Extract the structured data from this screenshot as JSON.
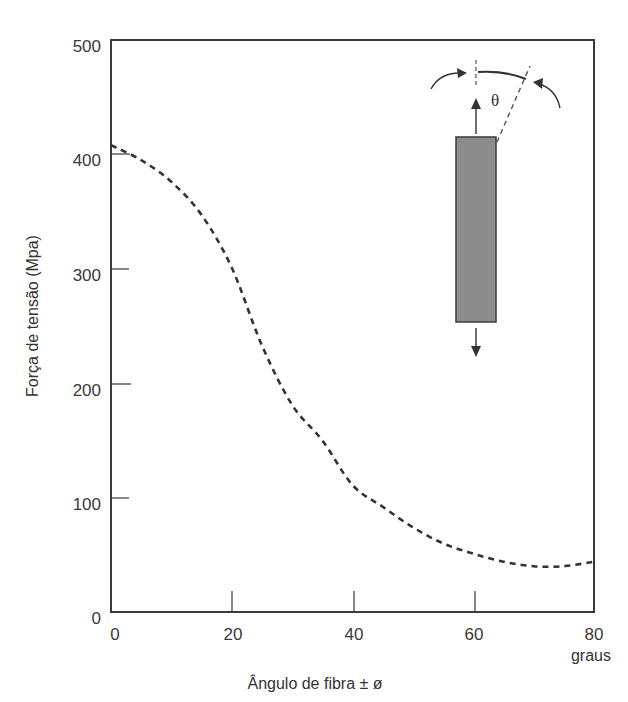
{
  "chart_data": {
    "type": "line",
    "title": "",
    "xlabel": "Ângulo de fibra ± ø",
    "xunit": "graus",
    "ylabel": "Força de tensão (Mpa)",
    "xlim": [
      0,
      80
    ],
    "ylim": [
      0,
      500
    ],
    "xticks": [
      0,
      20,
      40,
      60,
      80
    ],
    "yticks": [
      0,
      100,
      200,
      300,
      400,
      500
    ],
    "grid": false,
    "legend": null,
    "series": [
      {
        "name": "Força de tensão vs ângulo de fibra",
        "style": "dashed",
        "x": [
          0,
          5,
          10,
          15,
          20,
          25,
          30,
          35,
          40,
          45,
          50,
          55,
          60,
          65,
          70,
          75,
          80
        ],
        "y": [
          408,
          395,
          376,
          347,
          301,
          233,
          181,
          150,
          111,
          92,
          74,
          60,
          51,
          44,
          40,
          40,
          44
        ]
      }
    ],
    "inset_diagram": {
      "description": "Fibre-loaded specimen bar with tensile arrows; angle θ between load axis and fibre direction",
      "angle_symbol": "θ"
    }
  },
  "labels": {
    "y_axis": "Força de tensão (Mpa)",
    "x_axis": "Ângulo de fibra ± ø",
    "x_unit": "graus",
    "theta": "θ",
    "y_ticks": [
      "0",
      "100",
      "200",
      "300",
      "400",
      "500"
    ],
    "x_ticks": [
      "0",
      "20",
      "40",
      "60",
      "80"
    ]
  },
  "colors": {
    "axis": "#3a3a3a",
    "curve": "#333333",
    "bar_fill": "#8c8c8c",
    "bar_stroke": "#444444"
  }
}
